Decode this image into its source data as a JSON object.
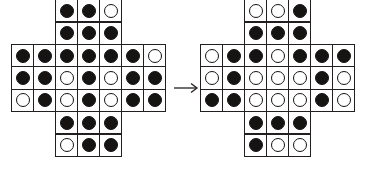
{
  "figure": {
    "arrow_symbol": "→",
    "arrow_name": "right-arrow-icon",
    "colors": {
      "stone_black": "#161313",
      "stone_white": "#ffffff",
      "cell_border": "#231f20",
      "background": "#ffffff"
    },
    "cell_legend": {
      "B": "black-stone",
      "W": "white-stone",
      "_": "no-cell"
    }
  },
  "boards": [
    {
      "id": "before",
      "name": "left-board",
      "rows": 7,
      "cols": 7,
      "shape": "plus-cross",
      "cells": [
        [
          "_",
          "_",
          "B",
          "B",
          "W",
          "_",
          "_"
        ],
        [
          "_",
          "_",
          "B",
          "B",
          "B",
          "_",
          "_"
        ],
        [
          "B",
          "B",
          "B",
          "B",
          "B",
          "B",
          "W"
        ],
        [
          "B",
          "B",
          "W",
          "B",
          "W",
          "B",
          "B"
        ],
        [
          "W",
          "B",
          "W",
          "B",
          "W",
          "B",
          "B"
        ],
        [
          "_",
          "_",
          "B",
          "B",
          "B",
          "_",
          "_"
        ],
        [
          "_",
          "_",
          "W",
          "B",
          "B",
          "_",
          "_"
        ]
      ]
    },
    {
      "id": "after",
      "name": "right-board",
      "rows": 7,
      "cols": 7,
      "shape": "plus-cross",
      "cells": [
        [
          "_",
          "_",
          "W",
          "W",
          "B",
          "_",
          "_"
        ],
        [
          "_",
          "_",
          "B",
          "B",
          "B",
          "_",
          "_"
        ],
        [
          "W",
          "B",
          "B",
          "W",
          "B",
          "B",
          "B"
        ],
        [
          "W",
          "B",
          "W",
          "W",
          "W",
          "B",
          "W"
        ],
        [
          "B",
          "B",
          "W",
          "W",
          "W",
          "B",
          "W"
        ],
        [
          "_",
          "_",
          "B",
          "B",
          "B",
          "_",
          "_"
        ],
        [
          "_",
          "_",
          "B",
          "W",
          "W",
          "_",
          "_"
        ]
      ]
    }
  ]
}
